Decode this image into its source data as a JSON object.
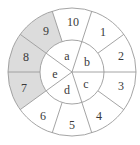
{
  "diagram": {
    "center": [
      72,
      72
    ],
    "outer_radius": 64,
    "inner_radius": 32,
    "stroke_color": "#9a9a9a",
    "shaded_fill": "#dcdcdc",
    "outer_segments": [
      {
        "label": "1",
        "shaded": false
      },
      {
        "label": "2",
        "shaded": false
      },
      {
        "label": "3",
        "shaded": false
      },
      {
        "label": "4",
        "shaded": false
      },
      {
        "label": "5",
        "shaded": false
      },
      {
        "label": "6",
        "shaded": false
      },
      {
        "label": "7",
        "shaded": true
      },
      {
        "label": "8",
        "shaded": true
      },
      {
        "label": "9",
        "shaded": true
      },
      {
        "label": "10",
        "shaded": false
      }
    ],
    "inner_segments": [
      {
        "label": "a"
      },
      {
        "label": "b"
      },
      {
        "label": "c"
      },
      {
        "label": "d"
      },
      {
        "label": "e"
      }
    ]
  }
}
